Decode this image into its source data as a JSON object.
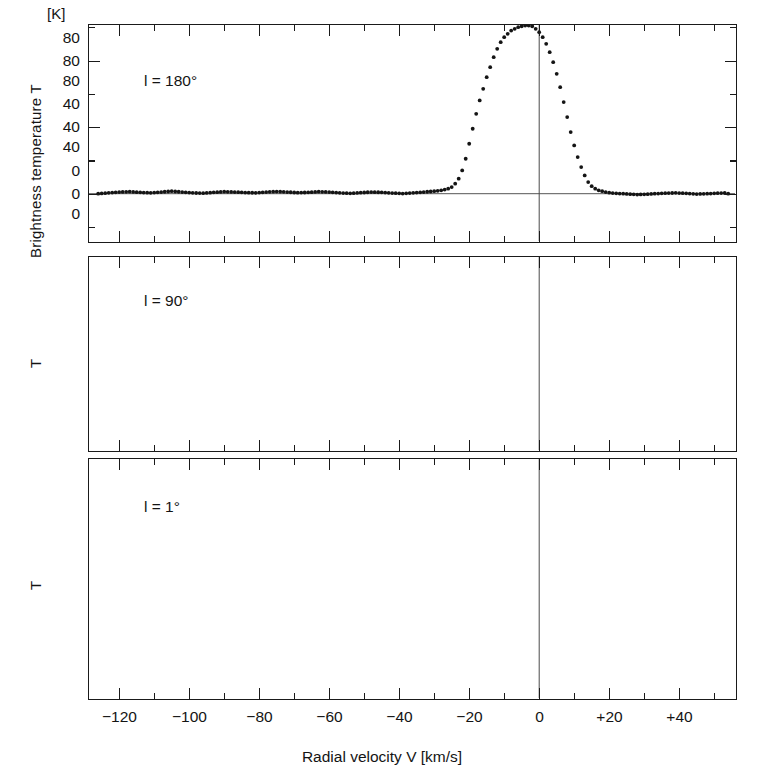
{
  "figure": {
    "unit_label": "[K]",
    "xlabel": "Radial velocity V  [km/s]",
    "ylabel_main": "Brightness temperature T",
    "ylabel_short": "T",
    "line_color": "#141414",
    "axis_color": "#1a1a1a",
    "baseline_color": "#555555"
  },
  "axis": {
    "x_major_labels": [
      "−120",
      "−100",
      "−80",
      "−60",
      "−40",
      "−20",
      "0",
      "+20",
      "+40"
    ],
    "x_major_values": [
      -120,
      -100,
      -80,
      -60,
      -40,
      -20,
      0,
      20,
      40
    ],
    "x_minor_values": [
      -130,
      -110,
      -90,
      -70,
      -50,
      -30,
      -10,
      10,
      30,
      50
    ],
    "x_range": [
      -129,
      -129
    ],
    "y_major_labels": [
      "0",
      "40",
      "80"
    ],
    "y_major_values": [
      0,
      40,
      80
    ],
    "y_minor_values": [
      20,
      60,
      100
    ]
  },
  "chart_data": {
    "type": "line",
    "title": "",
    "subtitle": "",
    "xlabel": "Radial velocity V  [km/s]",
    "ylabel": "Brightness temperature T",
    "unit": "K",
    "xlim": [
      -129,
      56
    ],
    "grid": false,
    "legend": "none",
    "marker": "dot",
    "panels": [
      {
        "id": "panel-1",
        "annotation": "l = 180°",
        "ylabel": "Brightness temperature T",
        "ylim": [
          -14,
          118
        ],
        "yticks_major": [
          0,
          40,
          80
        ],
        "yticks_minor": [
          20,
          60,
          100
        ],
        "zero_line": true,
        "vertical_zero_line": true,
        "series": [
          {
            "name": "l=180",
            "x": [
              -126,
              -123,
              -120,
              -117,
              -114,
              -111,
              -108,
              -105,
              -102,
              -99,
              -96,
              -93,
              -90,
              -87,
              -84,
              -81,
              -78,
              -75,
              -72,
              -69,
              -66,
              -63,
              -60,
              -57,
              -54,
              -51,
              -48,
              -45,
              -42,
              -39,
              -36,
              -33,
              -30,
              -28,
              -26,
              -25,
              -24,
              -23,
              -22,
              -21,
              -20,
              -19,
              -18,
              -17,
              -16,
              -15,
              -14,
              -13,
              -12,
              -11,
              -10,
              -9,
              -8,
              -7,
              -6,
              -5,
              -4,
              -3,
              -2,
              -1,
              0,
              1,
              2,
              3,
              4,
              5,
              6,
              7,
              8,
              9,
              10,
              11,
              12,
              13,
              14,
              15,
              16,
              17,
              18,
              19,
              20,
              22,
              24,
              26,
              28,
              30,
              33,
              36,
              39,
              42,
              45,
              48,
              51,
              54
            ],
            "y": [
              0,
              0.5,
              1,
              1.2,
              0.8,
              0.5,
              1,
              1.5,
              1,
              0.5,
              0.3,
              0.8,
              1.2,
              1,
              0.7,
              0.5,
              1,
              1.3,
              1,
              0.6,
              0.8,
              1.2,
              1,
              0.5,
              0.2,
              0.6,
              1,
              0.8,
              0.4,
              0.1,
              0.5,
              1,
              1.5,
              2,
              3,
              4,
              6,
              9,
              14,
              21,
              30,
              39,
              48,
              56,
              63,
              70,
              76,
              82,
              87,
              91,
              94,
              96,
              98,
              99,
              100,
              100.5,
              101,
              101,
              100.5,
              99,
              97,
              94,
              90,
              85,
              79,
              72,
              64,
              55,
              46,
              37,
              29,
              22,
              16,
              11,
              7,
              4.5,
              3,
              2,
              1.5,
              1,
              0.6,
              0.2,
              0,
              -0.3,
              -0.5,
              -0.4,
              0,
              0.3,
              0.5,
              0.2,
              -0.2,
              0,
              0.3,
              0.5,
              0.2,
              0
            ]
          }
        ]
      },
      {
        "id": "panel-2",
        "annotation": "l = 90°",
        "ylabel": "T",
        "ylim": [
          -12,
          100
        ],
        "yticks_major": [
          0,
          40,
          80
        ],
        "yticks_minor": [
          20,
          60,
          100
        ],
        "zero_line": true,
        "vertical_zero_line": true,
        "series": [
          {
            "name": "l=90",
            "x": [
              -118,
              -116,
              -114,
              -112,
              -110,
              -108,
              -106,
              -104,
              -102,
              -100,
              -98,
              -96,
              -94,
              -92,
              -90,
              -88,
              -86,
              -84,
              -82,
              -80,
              -78,
              -76,
              -74,
              -72,
              -70,
              -68,
              -66,
              -64,
              -62,
              -60,
              -58,
              -56,
              -54,
              -52,
              -50,
              -48,
              -46,
              -44,
              -42,
              -40,
              -38,
              -36,
              -34,
              -32,
              -30,
              -28,
              -26,
              -24,
              -22,
              -20,
              -18,
              -16,
              -14,
              -12,
              -10,
              -8,
              -6,
              -4,
              -2,
              0,
              1,
              2,
              3,
              4,
              5,
              6,
              7,
              8,
              9,
              10,
              11,
              12,
              13,
              14,
              16,
              18,
              20,
              22,
              24,
              26,
              28,
              30,
              33,
              36,
              39,
              42,
              45,
              48,
              51
            ],
            "y": [
              2,
              3,
              4,
              5,
              6,
              7,
              8,
              9,
              10,
              11,
              12,
              13,
              14,
              15,
              16,
              17,
              19,
              22,
              25,
              29,
              33,
              36,
              37,
              37,
              35,
              32,
              29,
              26,
              24,
              23,
              23,
              25,
              28,
              32,
              36,
              41,
              46,
              52,
              58,
              63,
              66,
              67,
              66,
              63,
              58,
              52,
              47,
              44,
              44,
              45,
              47,
              48,
              46,
              42,
              38,
              36,
              35,
              36,
              39,
              43,
              46,
              50,
              53,
              56,
              60,
              63,
              67,
              71,
              74,
              76,
              77,
              76,
              73,
              68,
              55,
              42,
              30,
              20,
              13,
              8,
              5,
              3.5,
              2.5,
              2,
              1.8,
              1.5,
              1.5,
              1.3,
              1.2,
              1.2
            ]
          }
        ]
      },
      {
        "id": "panel-3",
        "annotation": "l = 1°",
        "ylabel": "T",
        "ylim": [
          -12,
          132
        ],
        "yticks_major": [
          0,
          40,
          80
        ],
        "yticks_minor": [
          20,
          60,
          100,
          120
        ],
        "zero_line": true,
        "vertical_zero_line": true,
        "series": [
          {
            "name": "l=1-main",
            "x": [
              -120,
              -118,
              -116,
              -114,
              -112,
              -110,
              -108,
              -106,
              -104,
              -102,
              -100,
              -98,
              -96,
              -94,
              -92,
              -90,
              -88,
              -86,
              -84,
              -82,
              -80,
              -78,
              -76,
              -74,
              -72,
              -70,
              -68,
              -66,
              -64,
              -62,
              -60,
              -58,
              -56,
              -54,
              -52,
              -50,
              -48,
              -46,
              -44,
              -42,
              -41,
              -40,
              -39,
              -38,
              -36,
              -34,
              -32,
              -30,
              -28,
              -26,
              -24,
              -22,
              -20,
              -18,
              -16,
              -14,
              -12,
              -10,
              -8,
              -6,
              -4,
              -3,
              -2,
              -1,
              0,
              1,
              2,
              3,
              4
            ],
            "y": [
              0.5,
              1,
              1.2,
              1,
              1.5,
              1.2,
              1,
              1.5,
              2,
              1.8,
              1.5,
              2,
              2.5,
              2,
              2.5,
              3,
              3.5,
              4,
              5,
              6,
              7,
              8,
              10,
              11,
              13,
              14,
              15,
              16,
              17,
              18,
              19,
              20,
              21,
              22,
              22.5,
              23,
              23,
              22.5,
              22,
              19,
              16,
              14,
              17,
              20,
              22,
              24,
              26,
              29,
              33,
              38,
              44,
              52,
              62,
              73,
              84,
              95,
              105,
              112,
              116,
              114,
              110,
              107,
              106,
              107,
              108,
              107,
              103,
              98,
              92
            ]
          },
          {
            "name": "l=1-secondary",
            "x": [
              5,
              6,
              7,
              8,
              9,
              10,
              11,
              12,
              13,
              14,
              15,
              16,
              17,
              18,
              19,
              20,
              21,
              22,
              23,
              24,
              25,
              26,
              27,
              28,
              29,
              30,
              31,
              32,
              33,
              34,
              36,
              38,
              40,
              42,
              44,
              46,
              48,
              50,
              52
            ],
            "y": [
              36,
              50,
              60,
              72,
              82,
              95,
              104,
              105,
              102,
              98,
              94,
              90,
              86,
              82,
              78,
              74,
              70,
              65,
              60,
              55,
              50,
              45,
              40,
              36,
              32,
              28,
              25,
              23,
              21,
              20,
              19,
              18,
              18,
              17,
              16,
              16,
              15,
              14,
              13
            ]
          }
        ]
      }
    ]
  }
}
